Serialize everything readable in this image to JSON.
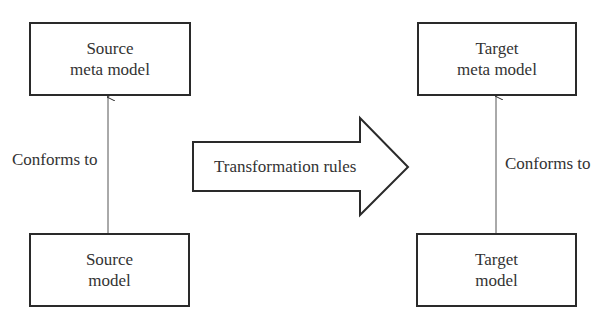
{
  "diagram": {
    "nodes": [
      {
        "id": "source-meta-model",
        "lines": [
          "Source",
          "meta model"
        ]
      },
      {
        "id": "source-model",
        "lines": [
          "Source",
          "model"
        ]
      },
      {
        "id": "target-meta-model",
        "lines": [
          "Target",
          "meta model"
        ]
      },
      {
        "id": "target-model",
        "lines": [
          "Target",
          "model"
        ]
      }
    ],
    "edges": [
      {
        "from": "source-model",
        "to": "source-meta-model",
        "label": "Conforms to"
      },
      {
        "from": "target-model",
        "to": "target-meta-model",
        "label": "Conforms to"
      }
    ],
    "transformation": {
      "label": "Transformation rules",
      "from": "source",
      "to": "target"
    }
  },
  "colors": {
    "stroke": "#2a2a2a",
    "text": "#333333",
    "background": "#ffffff"
  }
}
